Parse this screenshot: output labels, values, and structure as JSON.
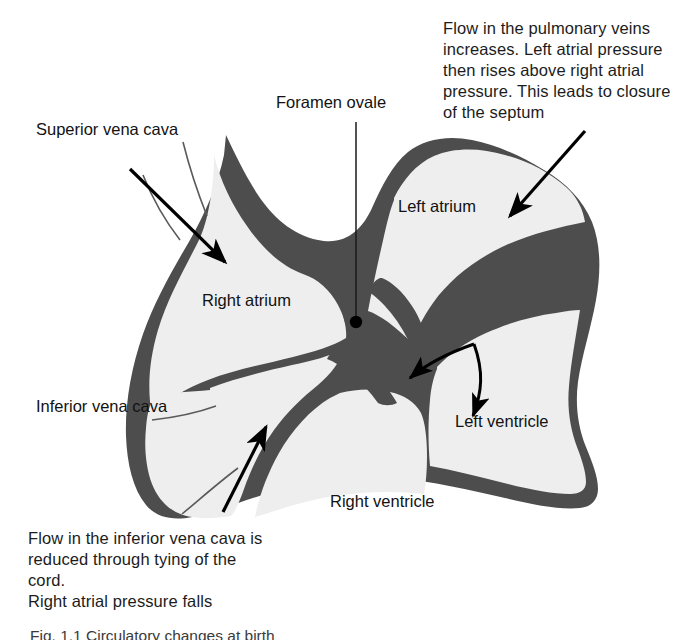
{
  "figure": {
    "colors": {
      "wall": "#4d4d4d",
      "chamber": "#eeeeee",
      "background": "#ffffff",
      "text": "#1c1c1c",
      "arrow": "#000000"
    }
  },
  "annotations": {
    "pulmonary": "Flow in the pulmonary veins increases. Left atrial pressure then rises above right atrial pressure. This leads to closure of the septum",
    "inferior_vena_cava": "Flow in the inferior vena cava is reduced through tying of the cord.\nRight atrial pressure falls"
  },
  "labels": {
    "superior_vena_cava": "Superior vena cava",
    "inferior_vena_cava": "Inferior vena cava",
    "foramen_ovale": "Foramen ovale",
    "right_atrium": "Right atrium",
    "left_atrium": "Left atrium",
    "left_ventricle": "Left ventricle",
    "right_ventricle": "Right ventricle"
  },
  "caption": {
    "text": "Fig. 1.1 Circulatory changes at birth"
  },
  "arrows": [
    {
      "name": "svc-inflow-arrow",
      "description": "arrow entering right atrium from superior vena cava, pointing down-right"
    },
    {
      "name": "ivc-inflow-arrow",
      "description": "arrow entering right atrium from inferior vena cava, pointing up-right"
    },
    {
      "name": "pulmonary-inflow-arrow",
      "description": "arrow entering left atrium from upper right, pointing down-left"
    },
    {
      "name": "septum-closure-arrow",
      "description": "arrow inside left atrium pointing left toward the septum"
    },
    {
      "name": "mitral-flow-arrow",
      "description": "curved arrow inside left atrium pointing down into the left ventricle"
    }
  ],
  "markers": {
    "foramen_ovale_dot": "filled black dot marking the foramen ovale on the interatrial septum"
  }
}
